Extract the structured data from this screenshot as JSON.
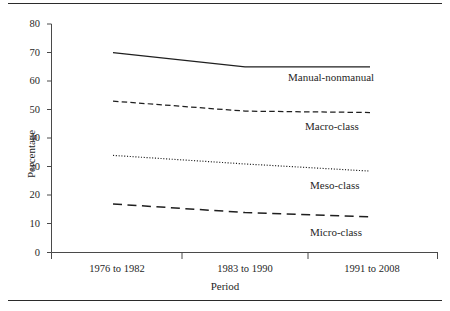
{
  "chart_data": {
    "type": "line",
    "title": "",
    "xlabel": "Period",
    "ylabel": "Percentage",
    "categories": [
      "1976 to 1982",
      "1983 to 1990",
      "1991 to 2008"
    ],
    "ylim": [
      0,
      80
    ],
    "yticks": [
      0,
      10,
      20,
      30,
      40,
      50,
      60,
      70,
      80
    ],
    "ytick_labels": [
      "0",
      "10",
      "20",
      "30",
      "40",
      "50",
      "60",
      "70",
      "80"
    ],
    "grid": false,
    "legend_position": "inline-right",
    "series": [
      {
        "name": "Manual-nonmanual",
        "style": "solid",
        "values": [
          70,
          65,
          65
        ]
      },
      {
        "name": "Macro-class",
        "style": "dashed",
        "values": [
          53,
          49.5,
          49
        ]
      },
      {
        "name": "Meso-class",
        "style": "dotted",
        "values": [
          34,
          31,
          28.5
        ]
      },
      {
        "name": "Micro-class",
        "style": "long-dashed",
        "values": [
          17,
          14,
          12.5
        ]
      }
    ]
  },
  "figure": {
    "background": "#ffffff",
    "ink_color": "#1f1f1f",
    "rule_color": "#2b2b2b"
  }
}
